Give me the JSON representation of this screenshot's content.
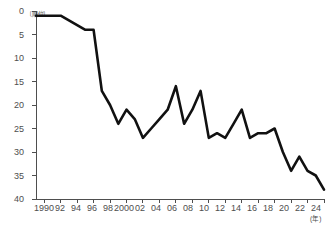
{
  "chart_data": {
    "type": "line",
    "title": "",
    "subtitle": "",
    "xlabel": "(年)",
    "ylabel": "〔順位〕",
    "y_unit_label": "〔順位〕",
    "x_unit_label": "(年)",
    "ylim": [
      0,
      40
    ],
    "y_inverted": true,
    "grid": false,
    "legend": "none",
    "y_ticks": [
      0,
      5,
      10,
      15,
      20,
      25,
      30,
      35,
      40
    ],
    "y_tick_labels": [
      "0",
      "5",
      "10",
      "15",
      "20",
      "25",
      "30",
      "35",
      "40"
    ],
    "x_ticks": [
      1990,
      1992,
      1994,
      1996,
      1998,
      2000,
      2002,
      2004,
      2006,
      2008,
      2010,
      2012,
      2014,
      2016,
      2018,
      2020,
      2022,
      2024
    ],
    "x_tick_labels": [
      "1990",
      "92",
      "94",
      "96",
      "98",
      "2000",
      "02",
      "04",
      "06",
      "08",
      "10",
      "12",
      "14",
      "16",
      "18",
      "20",
      "22",
      "24"
    ],
    "xlim": [
      1989,
      2024
    ],
    "x": [
      1989,
      1990,
      1991,
      1992,
      1993,
      1994,
      1995,
      1996,
      1997,
      1998,
      1999,
      2000,
      2001,
      2002,
      2003,
      2004,
      2005,
      2006,
      2007,
      2008,
      2009,
      2010,
      2011,
      2012,
      2013,
      2014,
      2015,
      2016,
      2017,
      2018,
      2019,
      2020,
      2021,
      2022,
      2023,
      2024
    ],
    "series": [
      {
        "name": "順位",
        "color": "#111111",
        "values": [
          1,
          1,
          1,
          1,
          2,
          3,
          4,
          4,
          17,
          20,
          24,
          21,
          23,
          27,
          25,
          23,
          21,
          16,
          24,
          21,
          17,
          27,
          26,
          27,
          24,
          21,
          27,
          26,
          26,
          25,
          30,
          34,
          31,
          34,
          35,
          38
        ]
      }
    ]
  }
}
